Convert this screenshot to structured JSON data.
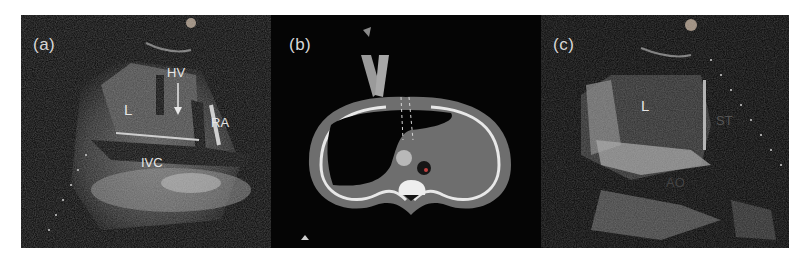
{
  "figure": {
    "panels": [
      {
        "id": "a",
        "label": "(a)",
        "annotations": {
          "L": "L",
          "HV": "HV",
          "RA": "RA",
          "IVC": "IVC"
        }
      },
      {
        "id": "b",
        "label": "(b)"
      },
      {
        "id": "c",
        "label": "(c)",
        "annotations": {
          "L": "L",
          "ST": "ST",
          "AO": "AO"
        }
      }
    ],
    "colors": {
      "background": "#050505",
      "page": "#ffffff",
      "label": "#d8d8d8",
      "tissue_gray": "#6e6e6e",
      "bone_white": "#e8e8e8"
    }
  }
}
